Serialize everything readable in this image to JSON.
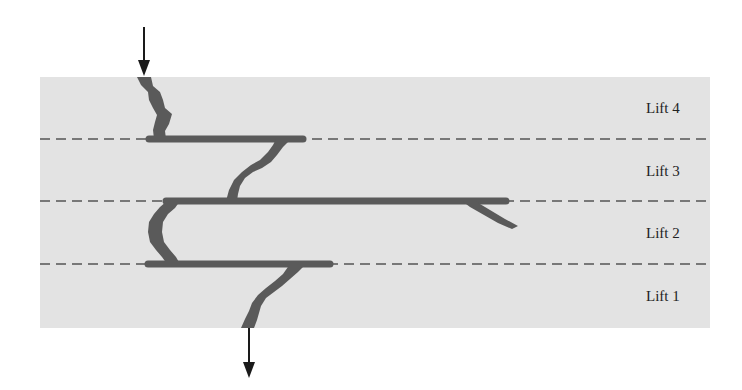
{
  "diagram": {
    "colors": {
      "background": "#ffffff",
      "panel": "#e3e3e3",
      "crack": "#5a5a5a",
      "dashed_line": "#555555",
      "arrow": "#1a1a1a",
      "label": "#222222"
    },
    "lifts": [
      {
        "id": "lift-4",
        "label": "Lift 4"
      },
      {
        "id": "lift-3",
        "label": "Lift 3"
      },
      {
        "id": "lift-2",
        "label": "Lift 2"
      },
      {
        "id": "lift-1",
        "label": "Lift 1"
      }
    ],
    "arrows": [
      {
        "id": "load-in",
        "direction": "down",
        "meaning": "crack enters at top"
      },
      {
        "id": "load-out",
        "direction": "down",
        "meaning": "crack exits at bottom"
      }
    ]
  }
}
